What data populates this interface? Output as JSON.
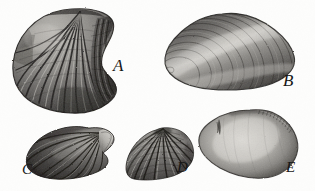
{
  "plate": {
    "kind": "fossil-shell-engraving-plate",
    "background_color": "#fdfdfc",
    "ink_color": "#171717",
    "width": 315,
    "height": 191,
    "specimen_count": 5
  },
  "specimens": [
    {
      "label": "A",
      "name": "large-ribbed-brachiopod",
      "position": "upper-left",
      "ornament": "strong radiating ribs converging to a beak at top, concave fold on right margin",
      "shading": "dark grooves between pale ribs, heavy shadow lower right"
    },
    {
      "label": "B",
      "name": "oval-concentric-bivalve",
      "position": "upper-right",
      "ornament": "fine concentric growth lines sweeping from lower-left umbo",
      "shading": "diagonal light highlight band across centre, dark upper and lower margins"
    },
    {
      "label": "C",
      "name": "winged-ribbed-shell",
      "position": "lower-left",
      "ornament": "radiating ribs fanning left from a pointed beak at upper right",
      "shading": "dark body with pale highlighted beak"
    },
    {
      "label": "D",
      "name": "fan-shaped-scallop",
      "position": "lower-centre",
      "ornament": "prominent radiating ribs crossed by fine concentric growth lines",
      "shading": "alternating pale ribs and dark interspaces"
    },
    {
      "label": "E",
      "name": "smooth-rounded-clam",
      "position": "lower-right",
      "ornament": "smooth surface, faint crenulated margin along upper right edge",
      "shading": "pale centre with dark shaded margins"
    }
  ],
  "labels": {
    "a": "A",
    "b": "B",
    "c": "C",
    "d": "D",
    "e": "E"
  }
}
